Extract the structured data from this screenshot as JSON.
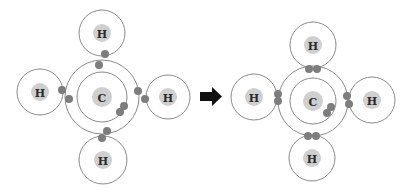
{
  "figure": {
    "arrow": "right-arrow",
    "colors": {
      "ring": "#8a8a8a",
      "nucleus": "#cfcfcf",
      "electron": "#7d7d7d",
      "arrow": "#111111",
      "label": "#2a2a2a"
    }
  },
  "before": {
    "carbon": {
      "label": "C",
      "cx": 102,
      "cy": 97
    },
    "hydrogens": [
      {
        "label": "H",
        "position": "top",
        "cx": 102,
        "cy": 33
      },
      {
        "label": "H",
        "position": "left",
        "cx": 40,
        "cy": 92
      },
      {
        "label": "H",
        "position": "right",
        "cx": 168,
        "cy": 97
      },
      {
        "label": "H",
        "position": "bottom",
        "cx": 103,
        "cy": 160
      }
    ]
  },
  "after": {
    "carbon": {
      "label": "C",
      "cx": 313,
      "cy": 101
    },
    "hydrogens": [
      {
        "label": "H",
        "position": "top",
        "cx": 313,
        "cy": 45
      },
      {
        "label": "H",
        "position": "left",
        "cx": 254,
        "cy": 97
      },
      {
        "label": "H",
        "position": "right",
        "cx": 372,
        "cy": 100
      },
      {
        "label": "H",
        "position": "bottom",
        "cx": 312,
        "cy": 158
      }
    ]
  }
}
